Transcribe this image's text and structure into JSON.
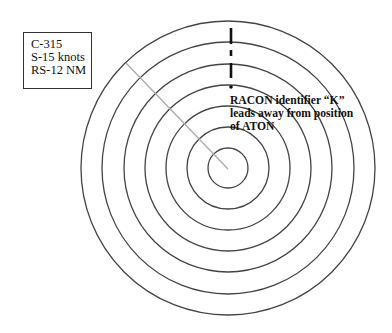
{
  "info_box": {
    "lines": [
      "C-315",
      "S-15 knots",
      "RS-12 NM"
    ]
  },
  "racon_label": {
    "lines": [
      "RACON identifier “K”",
      "leads away from position",
      "of ATON"
    ]
  },
  "radar": {
    "center": [
      228,
      168
    ],
    "ring_radii": [
      147,
      126,
      104,
      83,
      62,
      41,
      20
    ],
    "ring_color": "#444444",
    "heading_line": {
      "from": [
        126,
        63
      ],
      "to": [
        228,
        169
      ],
      "color": "#aaaaaa"
    },
    "racon_marks": [
      {
        "type": "dash",
        "x": 231,
        "y1": 28,
        "y2": 44
      },
      {
        "type": "dot-dash",
        "x": 231,
        "y1": 50,
        "y2": 56
      },
      {
        "type": "dash",
        "x": 231,
        "y1": 63,
        "y2": 78
      },
      {
        "type": "dot",
        "x": 231,
        "y": 87
      }
    ]
  }
}
